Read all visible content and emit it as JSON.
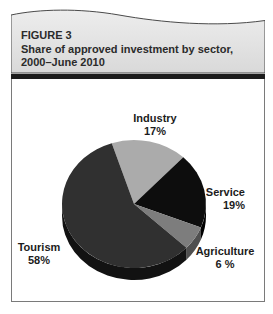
{
  "header": {
    "figure_label": "FIGURE 3",
    "title_line1": "Share of approved investment by sector,",
    "title_line2": "2000–June 2010"
  },
  "chart_data": {
    "type": "pie",
    "title": "Share of approved investment by sector, 2000–June 2010",
    "effect": "3d",
    "direction": "clockwise",
    "start_angle_deg": -18,
    "units": "percent",
    "slices": [
      {
        "name": "Industry",
        "value": 17,
        "pct_label": "17%",
        "color": "#ababab",
        "side_color": "#8a8a8a"
      },
      {
        "name": "Service",
        "value": 19,
        "pct_label": "19%",
        "color": "#0d0d0d",
        "side_color": "#000000"
      },
      {
        "name": "Agriculture",
        "value": 6,
        "pct_label": "6 %",
        "color": "#7d7d7d",
        "side_color": "#4f4f4f"
      },
      {
        "name": "Tourism",
        "value": 58,
        "pct_label": "58%",
        "color": "#303030",
        "side_color": "#121212"
      }
    ]
  },
  "colors": {
    "header_bg_top": "#ededed",
    "header_bg_bottom": "#d9d9d9",
    "header_border": "#4a4a4a",
    "divider_bar": "#1c1c1c",
    "panel_border": "#7a7a7a",
    "text": "#1c1c1c",
    "background": "#ffffff"
  }
}
